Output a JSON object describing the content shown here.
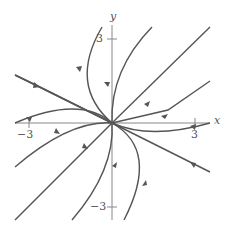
{
  "diagram": {
    "type": "phase-portrait",
    "axes": {
      "x_label": "x",
      "y_label": "y"
    },
    "ticks": {
      "x_pos": "3",
      "x_neg": "−3",
      "y_pos": "3",
      "y_neg": "−3"
    },
    "colors": {
      "curve": "#555555",
      "axis": "#888888"
    }
  }
}
